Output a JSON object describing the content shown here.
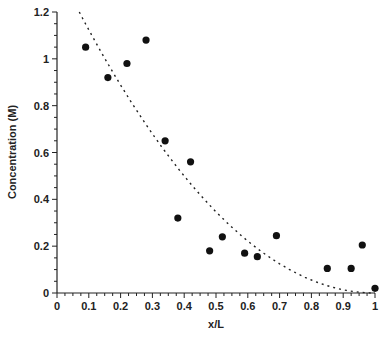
{
  "chart_data": {
    "type": "scatter",
    "title": "",
    "xlabel": "x/L",
    "ylabel": "Concentration (M)",
    "xlim": [
      0,
      1
    ],
    "ylim": [
      0,
      1.2
    ],
    "xticks": [
      "0",
      "0.1",
      "0.2",
      "0.3",
      "0.4",
      "0.5",
      "0.6",
      "0.7",
      "0.8",
      "0.9",
      "1"
    ],
    "yticks": [
      "0",
      "0.2",
      "0.4",
      "0.6",
      "0.8",
      "1",
      "1.2"
    ],
    "grid": false,
    "legend": null,
    "series": [
      {
        "name": "Measured",
        "style": "marker-filled-circle",
        "color": "#111111",
        "x": [
          0.09,
          0.16,
          0.22,
          0.28,
          0.34,
          0.38,
          0.42,
          0.48,
          0.52,
          0.59,
          0.63,
          0.69,
          0.85,
          0.925,
          0.96,
          1.0
        ],
        "y": [
          1.05,
          0.92,
          0.98,
          1.08,
          0.65,
          0.32,
          0.56,
          0.18,
          0.24,
          0.17,
          0.155,
          0.245,
          0.105,
          0.105,
          0.205,
          0.02
        ]
      },
      {
        "name": "Fit",
        "style": "dotted-line",
        "color": "#222222",
        "x": [
          0.07,
          0.1,
          0.2,
          0.3,
          0.4,
          0.5,
          0.6,
          0.7,
          0.8,
          0.9,
          1.0
        ],
        "y": [
          1.2,
          1.13,
          0.89,
          0.68,
          0.5,
          0.35,
          0.22,
          0.125,
          0.056,
          0.014,
          0.0
        ]
      }
    ]
  }
}
